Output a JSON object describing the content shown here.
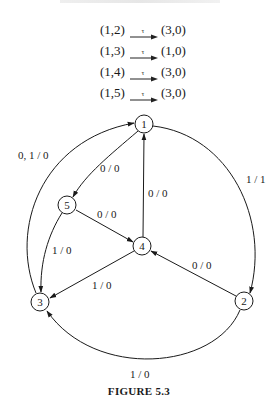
{
  "transitions": [
    {
      "from": "(1,2)",
      "symbol": "τ",
      "to": "(3,0)"
    },
    {
      "from": "(1,3)",
      "symbol": "τ",
      "to": "(1,0)"
    },
    {
      "from": "(1,4)",
      "symbol": "τ",
      "to": "(3,0)"
    },
    {
      "from": "(1,5)",
      "symbol": "τ",
      "to": "(3,0)"
    }
  ],
  "graph": {
    "nodes": [
      {
        "id": "1",
        "label": "1",
        "x": 144,
        "y": 124
      },
      {
        "id": "2",
        "label": "2",
        "x": 244,
        "y": 301
      },
      {
        "id": "3",
        "label": "3",
        "x": 40,
        "y": 302
      },
      {
        "id": "4",
        "label": "4",
        "x": 142,
        "y": 246
      },
      {
        "id": "5",
        "label": "5",
        "x": 67,
        "y": 205
      }
    ],
    "edges": [
      {
        "from": "3",
        "to": "1",
        "label": "0, 1 / 0"
      },
      {
        "from": "1",
        "to": "2",
        "label": "1 / 1"
      },
      {
        "from": "1",
        "to": "5",
        "label": "0 / 0"
      },
      {
        "from": "4",
        "to": "1",
        "label": "0 / 0"
      },
      {
        "from": "5",
        "to": "4",
        "label": "0 / 0"
      },
      {
        "from": "5",
        "to": "3",
        "label": "1 / 0"
      },
      {
        "from": "4",
        "to": "3",
        "label": "1 / 0"
      },
      {
        "from": "2",
        "to": "4",
        "label": "0 / 0"
      },
      {
        "from": "2",
        "to": "3",
        "label": "1 / 0"
      }
    ]
  },
  "caption": "FIGURE 5.3"
}
